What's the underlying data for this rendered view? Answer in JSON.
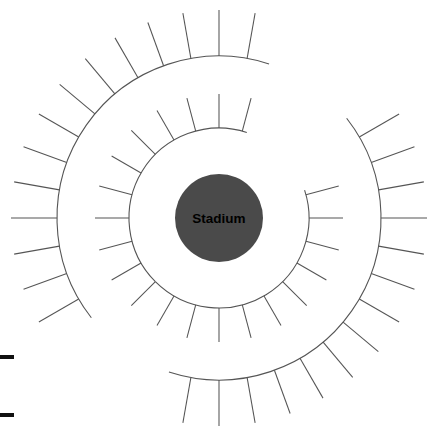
{
  "diagram": {
    "background_color": "#ffffff",
    "stroke_color": "#555555",
    "hub": {
      "label": "Stadium",
      "fill_color": "#4a4a4a",
      "text_color": "#000000",
      "center_x": 219,
      "center_y": 218,
      "radius": 44
    },
    "inner_ring": {
      "name": "inner-ring",
      "radius": 90,
      "spoke_length": 34,
      "spoke_count": 24,
      "gap_start_deg": -72,
      "gap_end_deg": -18
    },
    "outer_ring": {
      "name": "outer-ring",
      "radius": 162,
      "spoke_length": 46,
      "spoke_count": 36,
      "gaps": [
        {
          "start_deg": -72,
          "end_deg": -38
        },
        {
          "start_deg": 108,
          "end_deg": 142
        }
      ]
    },
    "edge_marks": [
      {
        "name": "edge-mark-upper",
        "x": 0,
        "y": 355,
        "width": 14,
        "height": 4
      },
      {
        "name": "edge-mark-lower",
        "x": 0,
        "y": 413,
        "width": 14,
        "height": 4
      }
    ]
  }
}
